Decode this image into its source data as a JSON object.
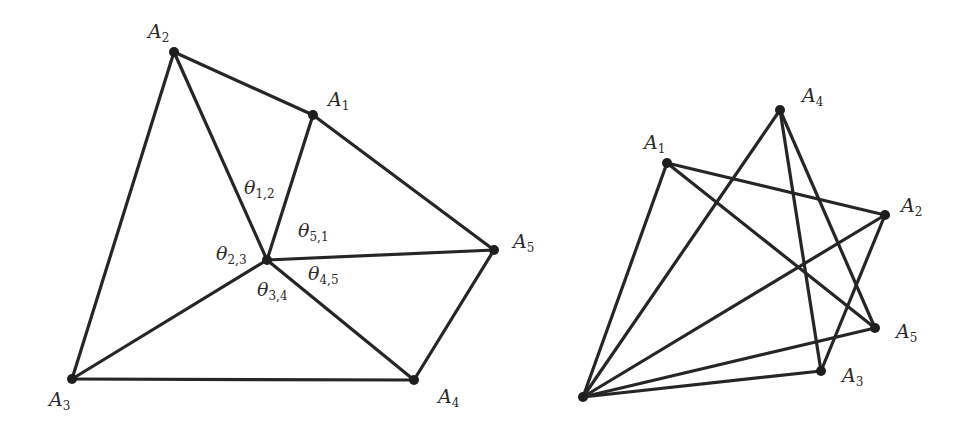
{
  "left_diagram": {
    "description": "Convex pentagon with interior point connected to all vertices, with angles labeled",
    "vertices": [
      {
        "id": "A1",
        "base": "A",
        "sub": "1",
        "x": 313,
        "y": 115,
        "lx": 328,
        "ly": 90
      },
      {
        "id": "A2",
        "base": "A",
        "sub": "2",
        "x": 174,
        "y": 52,
        "lx": 148,
        "ly": 22
      },
      {
        "id": "A3",
        "base": "A",
        "sub": "3",
        "x": 72,
        "y": 379,
        "lx": 49,
        "ly": 390
      },
      {
        "id": "A4",
        "base": "A",
        "sub": "4",
        "x": 414,
        "y": 380,
        "lx": 438,
        "ly": 387
      },
      {
        "id": "A5",
        "base": "A",
        "sub": "5",
        "x": 494,
        "y": 250,
        "lx": 513,
        "ly": 232
      },
      {
        "id": "O",
        "base": "",
        "sub": "",
        "x": 267,
        "y": 260
      }
    ],
    "edges": [
      [
        "A2",
        "A1"
      ],
      [
        "A1",
        "A5"
      ],
      [
        "A5",
        "A4"
      ],
      [
        "A4",
        "A3"
      ],
      [
        "A3",
        "A2"
      ],
      [
        "O",
        "A1"
      ],
      [
        "O",
        "A2"
      ],
      [
        "O",
        "A3"
      ],
      [
        "O",
        "A4"
      ],
      [
        "O",
        "A5"
      ]
    ],
    "angle_labels": [
      {
        "base": "θ",
        "sub": "1,2",
        "x": 244,
        "y": 178
      },
      {
        "base": "θ",
        "sub": "5,1",
        "x": 298,
        "y": 221
      },
      {
        "base": "θ",
        "sub": "2,3",
        "x": 216,
        "y": 244
      },
      {
        "base": "θ",
        "sub": "4,5",
        "x": 308,
        "y": 264
      },
      {
        "base": "θ",
        "sub": "3,4",
        "x": 257,
        "y": 280
      }
    ]
  },
  "right_diagram": {
    "description": "Star-shaped arrangement: base point connected to all A_i with crossing chords",
    "vertices": [
      {
        "id": "A1",
        "base": "A",
        "sub": "1",
        "x": 667,
        "y": 163,
        "lx": 644,
        "ly": 133
      },
      {
        "id": "A2",
        "base": "A",
        "sub": "2",
        "x": 885,
        "y": 215,
        "lx": 901,
        "ly": 196
      },
      {
        "id": "A3",
        "base": "A",
        "sub": "3",
        "x": 821,
        "y": 371,
        "lx": 842,
        "ly": 366
      },
      {
        "id": "A4",
        "base": "A",
        "sub": "4",
        "x": 780,
        "y": 110,
        "lx": 802,
        "ly": 86
      },
      {
        "id": "A5",
        "base": "A",
        "sub": "5",
        "x": 875,
        "y": 328,
        "lx": 896,
        "ly": 322
      },
      {
        "id": "O",
        "base": "",
        "sub": "",
        "x": 583,
        "y": 397
      }
    ],
    "edges": [
      [
        "O",
        "A1"
      ],
      [
        "O",
        "A4"
      ],
      [
        "O",
        "A2"
      ],
      [
        "O",
        "A5"
      ],
      [
        "O",
        "A3"
      ],
      [
        "A1",
        "A2"
      ],
      [
        "A1",
        "A5"
      ],
      [
        "A4",
        "A3"
      ],
      [
        "A4",
        "A5"
      ],
      [
        "A2",
        "A3"
      ]
    ]
  }
}
